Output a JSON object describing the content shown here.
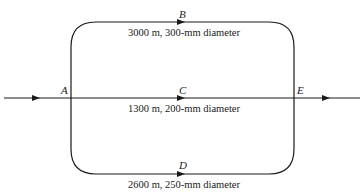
{
  "diagram": {
    "type": "pipe-network",
    "nodes": {
      "A": "A",
      "B": "B",
      "C": "C",
      "D": "D",
      "E": "E"
    },
    "pipes": [
      {
        "id": "top",
        "node": "B",
        "caption": "3000 m, 300-mm diameter"
      },
      {
        "id": "middle",
        "node": "C",
        "caption": "1300 m, 200-mm diameter"
      },
      {
        "id": "bottom",
        "node": "D",
        "caption": "2600 m, 250-mm diameter"
      }
    ],
    "colors": {
      "line": "#1a1a1a",
      "background": "#ffffff"
    }
  }
}
